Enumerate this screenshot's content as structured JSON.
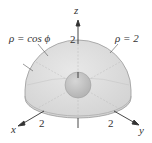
{
  "figure": {
    "labels": {
      "z_axis": "z",
      "x_axis": "x",
      "y_axis": "y",
      "z_tick": "2",
      "x_tick": "2",
      "y_tick": "2",
      "outer_surface": "ρ = 2",
      "inner_surface": "ρ = cos ϕ"
    },
    "colors": {
      "hemisphere_fill": "#dcdcdc",
      "hemisphere_edge": "#9a9a9a",
      "sphere_fill": "#c4c4c4",
      "axis": "#333333",
      "text": "#333333"
    }
  }
}
